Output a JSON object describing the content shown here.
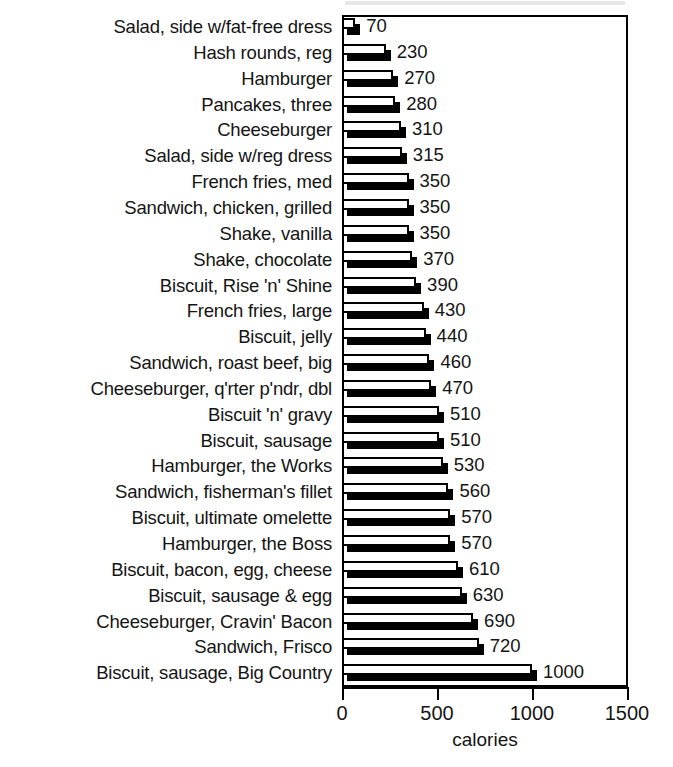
{
  "chart_data": {
    "type": "bar",
    "orientation": "horizontal",
    "title": "",
    "xlabel": "calories",
    "ylabel": "",
    "xlim": [
      0,
      1500
    ],
    "xticks": [
      0,
      500,
      1000,
      1500
    ],
    "xticklabels": [
      "0",
      "500",
      "1000",
      "1500"
    ],
    "grid": false,
    "legend": null,
    "bar_style": "3d-shadow-white-fill",
    "value_labels_shown": true,
    "sorted": "ascending-top-to-bottom",
    "categories": [
      "Salad, side w/fat-free dress",
      "Hash rounds, reg",
      "Hamburger",
      "Pancakes, three",
      "Cheeseburger",
      "Salad, side w/reg dress",
      "French fries, med",
      "Sandwich, chicken, grilled",
      "Shake, vanilla",
      "Shake, chocolate",
      "Biscuit, Rise 'n' Shine",
      "French fries, large",
      "Biscuit, jelly",
      "Sandwich, roast beef, big",
      "Cheeseburger, q'rter p'ndr, dbl",
      "Biscuit 'n' gravy",
      "Biscuit, sausage",
      "Hamburger, the Works",
      "Sandwich, fisherman's fillet",
      "Biscuit, ultimate omelette",
      "Hamburger, the Boss",
      "Biscuit, bacon, egg, cheese",
      "Biscuit, sausage & egg",
      "Cheeseburger, Cravin' Bacon",
      "Sandwich, Frisco",
      "Biscuit, sausage, Big Country"
    ],
    "values": [
      70,
      230,
      270,
      280,
      310,
      315,
      350,
      350,
      350,
      370,
      390,
      430,
      440,
      460,
      470,
      510,
      510,
      530,
      560,
      570,
      570,
      610,
      630,
      690,
      720,
      1000
    ],
    "value_labels": [
      "70",
      "230",
      "270",
      "280",
      "310",
      "315",
      "350",
      "350",
      "350",
      "370",
      "390",
      "430",
      "440",
      "460",
      "470",
      "510",
      "510",
      "530",
      "560",
      "570",
      "570",
      "610",
      "630",
      "690",
      "720",
      "1000"
    ]
  },
  "colors": {
    "bar_fill": "#ffffff",
    "bar_outline": "#000000",
    "bar_shadow": "#000000",
    "text": "#141414",
    "frame": "#000000",
    "background": "#ffffff"
  }
}
